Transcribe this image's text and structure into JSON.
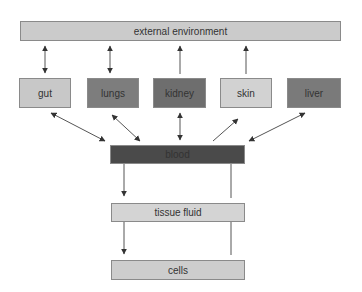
{
  "diagram": {
    "nodes": {
      "external": {
        "label": "external environment",
        "color": "#cbcbcb"
      },
      "gut": {
        "label": "gut",
        "color": "#c8c8c8"
      },
      "lungs": {
        "label": "lungs",
        "color": "#7d7d7d"
      },
      "kidney": {
        "label": "kidney",
        "color": "#6e6e6e"
      },
      "skin": {
        "label": "skin",
        "color": "#d2d2d2"
      },
      "liver": {
        "label": "liver",
        "color": "#7a7a7a"
      },
      "blood": {
        "label": "blood",
        "color": "#4a4a4a"
      },
      "tissue": {
        "label": "tissue fluid",
        "color": "#d4d4d4"
      },
      "cells": {
        "label": "cells",
        "color": "#cdcdcd"
      }
    },
    "edges": [
      {
        "from": "external",
        "to": "gut",
        "direction": "both"
      },
      {
        "from": "external",
        "to": "lungs",
        "direction": "both"
      },
      {
        "from": "kidney",
        "to": "external",
        "direction": "forward"
      },
      {
        "from": "skin",
        "to": "external",
        "direction": "forward"
      },
      {
        "from": "gut",
        "to": "blood",
        "direction": "both"
      },
      {
        "from": "lungs",
        "to": "blood",
        "direction": "both"
      },
      {
        "from": "kidney",
        "to": "blood",
        "direction": "both"
      },
      {
        "from": "blood",
        "to": "skin",
        "direction": "forward"
      },
      {
        "from": "liver",
        "to": "blood",
        "direction": "both"
      },
      {
        "from": "blood",
        "to": "tissue",
        "direction": "forward"
      },
      {
        "from": "tissue",
        "to": "blood",
        "direction": "forward"
      },
      {
        "from": "tissue",
        "to": "cells",
        "direction": "forward"
      },
      {
        "from": "cells",
        "to": "tissue",
        "direction": "forward"
      }
    ]
  }
}
